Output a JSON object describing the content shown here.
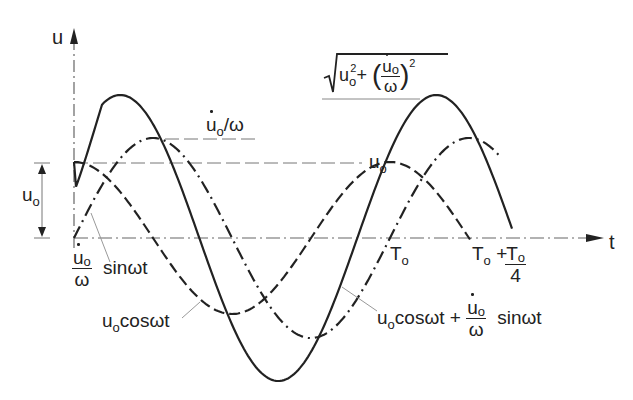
{
  "diagram": {
    "axes": {
      "vertical_label": "u",
      "horizontal_label": "t"
    },
    "labels": {
      "u0_right": "u",
      "u0_right_sub": "o",
      "u0_dim": "u",
      "u0_dim_sub": "o",
      "vel_amp": "u",
      "vel_amp_sub": "o",
      "vel_amp_tail": "/ω",
      "sin_num": "u",
      "sin_num_sub": "o",
      "sin_den": "ω",
      "sin_tail": "sinωt",
      "cos_label": "u",
      "cos_label_sub": "o",
      "cos_label_tail": "cosωt",
      "T0": "T",
      "T0_sub": "o",
      "T0q_a": "T",
      "T0q_a_sub": "o",
      "T0q_plus": "+",
      "T0q_num": "T",
      "T0q_num_sub": "o",
      "T0q_den": "4",
      "sum_a": "u",
      "sum_a_sub": "o",
      "sum_a_tail": "cosωt +",
      "sum_num": "u",
      "sum_num_sub": "o",
      "sum_den": "ω",
      "sum_tail": "sinωt",
      "amp_u": "u",
      "amp_u_sub": "o",
      "amp_sq": "2",
      "amp_plus": "+",
      "amp_num": "u",
      "amp_num_sub": "o",
      "amp_den": "ω",
      "amp_sq2": "2"
    },
    "geometry": {
      "origin_x": 74,
      "axis_y": 238,
      "period_px": 316,
      "u0_px": 76,
      "vel_amp_px": 100,
      "resultant_amp_px": 143,
      "x_end_cos": 471,
      "x_end_sin": 500,
      "x_end_sum": 512
    },
    "colors": {
      "ink": "#222222",
      "guide": "#777777",
      "leader": "#999999"
    },
    "curves": [
      {
        "name": "u0 cos ωt",
        "style": "dashed"
      },
      {
        "name": "(u̇0/ω) sin ωt",
        "style": "dash-dot"
      },
      {
        "name": "u0 cos ωt + (u̇0/ω) sin ωt",
        "style": "solid"
      }
    ]
  }
}
